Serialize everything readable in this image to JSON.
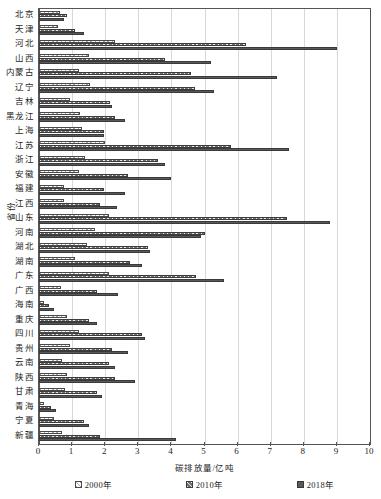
{
  "chart_data": {
    "type": "bar",
    "orientation": "horizontal",
    "title": "",
    "xlabel": "碳排放量/亿吨",
    "ylabel": "省份",
    "xlim": [
      0,
      10
    ],
    "xticks": [
      "0",
      "1",
      "2",
      "3",
      "4",
      "5",
      "6",
      "7",
      "8",
      "9",
      "10"
    ],
    "grid": "vertical",
    "legend_position": "bottom",
    "categories": [
      "北京",
      "天津",
      "河北",
      "山西",
      "内蒙古",
      "辽宁",
      "吉林",
      "黑龙江",
      "上海",
      "江苏",
      "浙江",
      "安徽",
      "福建",
      "江西",
      "山东",
      "河南",
      "湖北",
      "湖南",
      "广东",
      "广西",
      "海南",
      "重庆",
      "四川",
      "贵州",
      "云南",
      "陕西",
      "甘肃",
      "青海",
      "宁夏",
      "新疆"
    ],
    "series": [
      {
        "name": "2000年",
        "values": [
          0.62,
          0.56,
          2.3,
          1.5,
          1.2,
          1.55,
          0.95,
          1.25,
          1.3,
          2.0,
          1.4,
          1.2,
          0.75,
          0.75,
          2.1,
          1.7,
          1.45,
          1.1,
          2.1,
          0.65,
          0.15,
          0.85,
          1.2,
          0.95,
          0.7,
          0.85,
          0.8,
          0.15,
          0.45,
          0.7
        ]
      },
      {
        "name": "2010年",
        "values": [
          0.85,
          1.1,
          6.25,
          3.8,
          4.6,
          4.7,
          2.15,
          2.3,
          1.95,
          5.8,
          3.6,
          2.7,
          1.95,
          1.85,
          7.5,
          5.0,
          3.3,
          2.75,
          4.75,
          1.75,
          0.3,
          1.5,
          3.1,
          2.2,
          2.1,
          2.3,
          1.75,
          0.35,
          1.35,
          1.85
        ]
      },
      {
        "name": "2018年",
        "values": [
          0.75,
          1.35,
          9.0,
          5.2,
          7.2,
          5.3,
          2.2,
          2.6,
          1.95,
          7.55,
          3.8,
          4.0,
          2.6,
          2.35,
          8.8,
          4.9,
          3.35,
          3.1,
          5.6,
          2.4,
          0.45,
          1.75,
          3.2,
          2.7,
          2.3,
          2.9,
          1.9,
          0.5,
          1.5,
          4.15
        ]
      }
    ]
  },
  "legend": {
    "items": [
      {
        "label": "2000年",
        "swatch": "open-hatch-swatch"
      },
      {
        "label": "2010年",
        "swatch": "dense-hatch-swatch"
      },
      {
        "label": "2018年",
        "swatch": "solid-dark-swatch"
      }
    ]
  },
  "colors": {
    "bar_2000": "#ffffff",
    "bar_2010": "#6f6f6f",
    "bar_2018": "#59595b",
    "grid": "#d8d8d8",
    "axis": "#555555",
    "text": "#1d1d1d"
  }
}
